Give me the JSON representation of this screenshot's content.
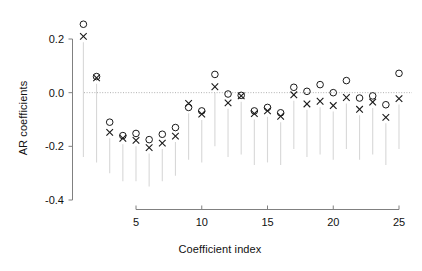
{
  "chart_data": {
    "type": "scatter",
    "title": "",
    "xlabel": "Coefficient index",
    "ylabel": "AR coefficients",
    "xlim": [
      0.3,
      25.7
    ],
    "ylim": [
      -0.45,
      0.28
    ],
    "xticks": [
      5,
      10,
      15,
      20,
      25
    ],
    "xtick_labels": [
      "5",
      "10",
      "15",
      "20",
      "25"
    ],
    "yticks": [
      0.2,
      0.0,
      -0.2,
      -0.4
    ],
    "ytick_labels": [
      "0.2",
      "0.0",
      "-0.2",
      "-0.4"
    ],
    "grid": false,
    "zero_line": 0.0,
    "zero_line_style": "dotted",
    "legend": "none",
    "x": [
      1,
      2,
      3,
      4,
      5,
      6,
      7,
      8,
      9,
      10,
      11,
      12,
      13,
      14,
      15,
      16,
      17,
      18,
      19,
      20,
      21,
      22,
      23,
      24,
      25
    ],
    "series": [
      {
        "name": "circle-series",
        "marker": "o",
        "color": "#1a1a1a",
        "values": [
          0.255,
          0.06,
          -0.11,
          -0.16,
          -0.152,
          -0.175,
          -0.155,
          -0.13,
          -0.055,
          -0.068,
          0.068,
          -0.005,
          -0.01,
          -0.068,
          -0.055,
          -0.075,
          0.02,
          0.005,
          0.03,
          0.0,
          0.045,
          -0.02,
          -0.012,
          -0.045,
          0.072
        ]
      },
      {
        "name": "cross-series",
        "marker": "x",
        "color": "#1a1a1a",
        "values": [
          0.21,
          0.055,
          -0.148,
          -0.17,
          -0.178,
          -0.205,
          -0.188,
          -0.162,
          -0.04,
          -0.08,
          0.022,
          -0.038,
          -0.012,
          -0.078,
          -0.068,
          -0.088,
          -0.008,
          -0.042,
          -0.032,
          -0.048,
          -0.018,
          -0.062,
          -0.035,
          -0.092,
          -0.022
        ]
      }
    ],
    "error_bars": {
      "description": "faint vertical grey lines extending downward from each marker",
      "color": "#d8d8d8",
      "lower": [
        -0.24,
        -0.26,
        -0.3,
        -0.33,
        -0.33,
        -0.35,
        -0.33,
        -0.31,
        -0.25,
        -0.26,
        -0.2,
        -0.24,
        -0.23,
        -0.27,
        -0.26,
        -0.27,
        -0.21,
        -0.24,
        -0.23,
        -0.25,
        -0.21,
        -0.25,
        -0.23,
        -0.27,
        -0.21
      ]
    }
  },
  "axes": {
    "ylabel_text": "AR coefficients",
    "xlabel_text": "Coefficient index"
  }
}
